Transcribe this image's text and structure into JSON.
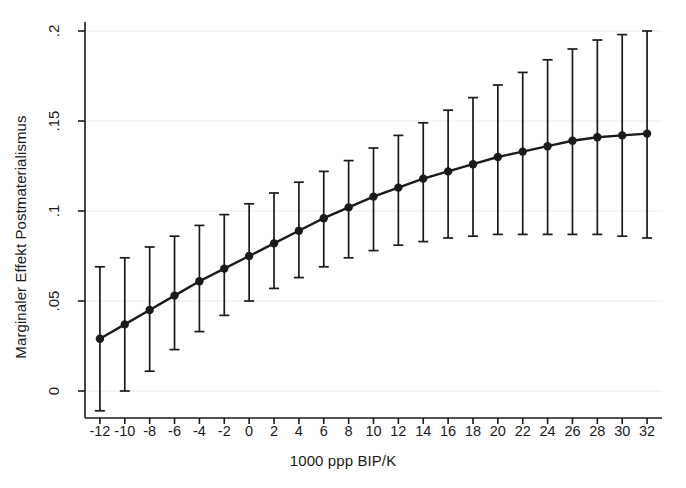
{
  "chart_data": {
    "type": "line",
    "title": "",
    "subtitle": "",
    "xlabel": "1000 ppp BIP/K",
    "ylabel": "Marginaler Effekt Postmaterialismus",
    "xlim": [
      -13.2,
      33.2
    ],
    "ylim": [
      -0.015,
      0.205
    ],
    "xticks": [
      -12,
      -10,
      -8,
      -6,
      -4,
      -2,
      0,
      2,
      4,
      6,
      8,
      10,
      12,
      14,
      16,
      18,
      20,
      22,
      24,
      26,
      28,
      30,
      32
    ],
    "xtick_labels": [
      "-12",
      "-10",
      "-8",
      "-6",
      "-4",
      "-2",
      "0",
      "2",
      "4",
      "6",
      "8",
      "10",
      "12",
      "14",
      "16",
      "18",
      "20",
      "22",
      "24",
      "26",
      "28",
      "30",
      "32"
    ],
    "yticks": [
      0,
      0.05,
      0.1,
      0.15,
      0.2
    ],
    "ytick_labels": [
      "0",
      ".05",
      ".1",
      ".15",
      ".2"
    ],
    "grid": "horizontal-faint",
    "legend": "none",
    "marker": "filled-circle",
    "error_bars": "vertical-capped",
    "line_color": "#1a1a1a",
    "marker_color": "#1a1a1a",
    "error_color": "#1a1a1a",
    "background": "#ffffff",
    "x": [
      -12,
      -10,
      -8,
      -6,
      -4,
      -2,
      0,
      2,
      4,
      6,
      8,
      10,
      12,
      14,
      16,
      18,
      20,
      22,
      24,
      26,
      28,
      30,
      32
    ],
    "series": [
      {
        "name": "Marginaler Effekt Postmaterialismus",
        "values": [
          0.029,
          0.037,
          0.045,
          0.053,
          0.061,
          0.068,
          0.075,
          0.082,
          0.089,
          0.096,
          0.102,
          0.108,
          0.113,
          0.118,
          0.122,
          0.126,
          0.13,
          0.133,
          0.136,
          0.139,
          0.141,
          0.142,
          0.143
        ],
        "ci_lower": [
          -0.011,
          0.0,
          0.011,
          0.023,
          0.033,
          0.042,
          0.05,
          0.057,
          0.063,
          0.069,
          0.074,
          0.078,
          0.081,
          0.083,
          0.085,
          0.086,
          0.087,
          0.087,
          0.087,
          0.087,
          0.087,
          0.086,
          0.085
        ],
        "ci_upper": [
          0.069,
          0.074,
          0.08,
          0.086,
          0.092,
          0.098,
          0.104,
          0.11,
          0.116,
          0.122,
          0.128,
          0.135,
          0.142,
          0.149,
          0.156,
          0.163,
          0.17,
          0.177,
          0.184,
          0.19,
          0.195,
          0.198,
          0.2
        ]
      }
    ]
  }
}
